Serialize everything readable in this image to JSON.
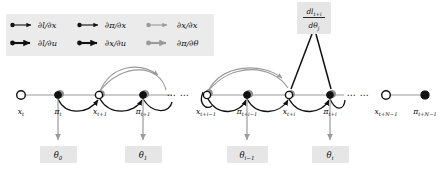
{
  "figure": {
    "background_color": "#ffffff",
    "accent_gray": "#9a9a9a",
    "accent_black": "#111111",
    "box_fill": "#e6e6e6",
    "legend_fill": "#ebebeb"
  },
  "legend": {
    "items": [
      {
        "id": "dl_dx",
        "label": "∂l/∂x",
        "color": "#111111",
        "weight": "thin",
        "row": 0,
        "col": 0
      },
      {
        "id": "dpi_dx",
        "label": "∂π/∂x",
        "color": "#111111",
        "weight": "thin",
        "row": 0,
        "col": 1
      },
      {
        "id": "dx_dx",
        "label": "∂x/∂x",
        "color": "#9a9a9a",
        "weight": "thin",
        "row": 0,
        "col": 2
      },
      {
        "id": "dl_du",
        "label": "∂l/∂u",
        "color": "#111111",
        "weight": "thick",
        "row": 1,
        "col": 0
      },
      {
        "id": "dx_du",
        "label": "∂x/∂u",
        "color": "#111111",
        "weight": "thick",
        "row": 1,
        "col": 1
      },
      {
        "id": "dpi_dth",
        "label": "∂π/∂θ",
        "color": "#9a9a9a",
        "weight": "thick",
        "row": 1,
        "col": 2
      }
    ]
  },
  "derivative_box": {
    "numerator": "dl",
    "numerator_sub": "t+i",
    "denominator": "dθ",
    "denominator_sub": "j",
    "full_label": "dl_{t+i} / dθ_j"
  },
  "graph": {
    "nodes": [
      {
        "id": "x_t",
        "base": "x",
        "sub": "t",
        "style": "open",
        "x": 21,
        "y": 95
      },
      {
        "id": "pi_t",
        "base": "π",
        "sub": "t",
        "style": "filled",
        "x": 58,
        "y": 95
      },
      {
        "id": "x_t1",
        "base": "x",
        "sub": "t+1",
        "style": "mixed",
        "x": 100,
        "y": 95
      },
      {
        "id": "pi_t1",
        "base": "π",
        "sub": "t+1",
        "style": "filled",
        "x": 143,
        "y": 95
      },
      {
        "id": "x_tim1",
        "base": "x",
        "sub": "t+i−1",
        "style": "mixed",
        "x": 208,
        "y": 95
      },
      {
        "id": "pi_tim1",
        "base": "π",
        "sub": "t+i−1",
        "style": "filled",
        "x": 247,
        "y": 95
      },
      {
        "id": "x_ti",
        "base": "x",
        "sub": "t+i",
        "style": "mixed",
        "x": 289,
        "y": 95
      },
      {
        "id": "pi_ti",
        "base": "π",
        "sub": "t+i",
        "style": "filled",
        "x": 330,
        "y": 95
      },
      {
        "id": "x_tN1",
        "base": "x",
        "sub": "t+N−1",
        "style": "open",
        "x": 386,
        "y": 95
      },
      {
        "id": "pi_tN1",
        "base": "π",
        "sub": "t+N−1",
        "style": "filled",
        "x": 425,
        "y": 95
      }
    ],
    "ellipses": [
      {
        "id": "ellipsis-mid",
        "text": "⋯ ⋯",
        "x": 178,
        "y": 97
      },
      {
        "id": "ellipsis-right",
        "text": "⋯ ⋯",
        "x": 357,
        "y": 97
      }
    ],
    "theta_boxes": [
      {
        "id": "theta_0",
        "base": "θ",
        "sub": "0",
        "x": 58,
        "y": 155,
        "source_node": "pi_t"
      },
      {
        "id": "theta_1",
        "base": "θ",
        "sub": "1",
        "x": 143,
        "y": 155,
        "source_node": "pi_t1"
      },
      {
        "id": "theta_im1",
        "base": "θ",
        "sub": "i−1",
        "x": 247,
        "y": 155,
        "source_node": "pi_tim1"
      },
      {
        "id": "theta_i",
        "base": "θ",
        "sub": "i",
        "x": 330,
        "y": 155,
        "source_node": "pi_ti"
      }
    ]
  }
}
